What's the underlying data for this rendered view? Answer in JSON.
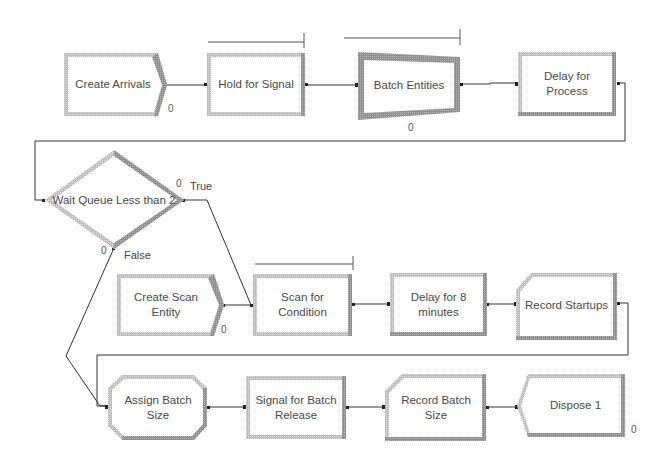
{
  "diagram": {
    "modules": [
      {
        "id": "create-arrivals",
        "label": "Create Arrivals",
        "type": "create",
        "counter": "0"
      },
      {
        "id": "hold-for-signal",
        "label": "Hold for Signal",
        "type": "hold"
      },
      {
        "id": "batch-entities",
        "label": "Batch Entities",
        "type": "batch",
        "counter": "0"
      },
      {
        "id": "delay-for-process",
        "label": "Delay for Process",
        "type": "process"
      },
      {
        "id": "wait-queue-decide",
        "label": "Wait Queue Less than 2",
        "type": "decide",
        "true_counter": "0",
        "false_counter": "0",
        "true_label": "True",
        "false_label": "False"
      },
      {
        "id": "create-scan-entity",
        "label": "Create Scan Entity",
        "type": "create",
        "counter": "0"
      },
      {
        "id": "scan-for-condition",
        "label": "Scan for Condition",
        "type": "hold"
      },
      {
        "id": "delay-for-8-minutes",
        "label": "Delay for 8 minutes",
        "type": "process"
      },
      {
        "id": "record-startups",
        "label": "Record Startups",
        "type": "record"
      },
      {
        "id": "assign-batch-size",
        "label": "Assign Batch Size",
        "type": "assign"
      },
      {
        "id": "signal-for-batch-release",
        "label": "Signal for Batch Release",
        "type": "signal"
      },
      {
        "id": "record-batch-size",
        "label": "Record Batch Size",
        "type": "record"
      },
      {
        "id": "dispose-1",
        "label": "Dispose 1",
        "type": "dispose",
        "counter": "0"
      }
    ],
    "connections": [
      [
        "create-arrivals",
        "hold-for-signal"
      ],
      [
        "hold-for-signal",
        "batch-entities"
      ],
      [
        "batch-entities",
        "delay-for-process"
      ],
      [
        "delay-for-process",
        "wait-queue-decide"
      ],
      [
        "wait-queue-decide:true",
        "scan-for-condition"
      ],
      [
        "wait-queue-decide:false",
        "assign-batch-size"
      ],
      [
        "create-scan-entity",
        "scan-for-condition"
      ],
      [
        "scan-for-condition",
        "delay-for-8-minutes"
      ],
      [
        "delay-for-8-minutes",
        "record-startups"
      ],
      [
        "record-startups",
        "assign-batch-size"
      ],
      [
        "assign-batch-size",
        "signal-for-batch-release"
      ],
      [
        "signal-for-batch-release",
        "record-batch-size"
      ],
      [
        "record-batch-size",
        "dispose-1"
      ]
    ]
  },
  "labels": {
    "create_arrivals": "Create Arrivals",
    "hold_for_signal": "Hold for Signal",
    "batch_entities": "Batch Entities",
    "delay_for_process": "Delay for Process",
    "wait_queue": "Wait Queue Less than 2",
    "create_scan_entity": "Create Scan Entity",
    "scan_for_condition": "Scan for Condition",
    "delay_for_8": "Delay for 8 minutes",
    "record_startups": "Record Startups",
    "assign_batch_size": "Assign Batch Size",
    "signal_for_batch_release": "Signal for Batch Release",
    "record_batch_size": "Record Batch Size",
    "dispose_1": "Dispose 1",
    "true_label": "True",
    "false_label": "False"
  },
  "counters": {
    "create_arrivals": "0",
    "batch_entities": "0",
    "decide_true": "0",
    "decide_false": "0",
    "create_scan_entity": "0",
    "dispose_1": "0"
  },
  "colors": {
    "border_light": "#c8c8c8",
    "border_dark": "#8a8a8a",
    "connector": "#333333",
    "text": "#4a4a4a"
  }
}
